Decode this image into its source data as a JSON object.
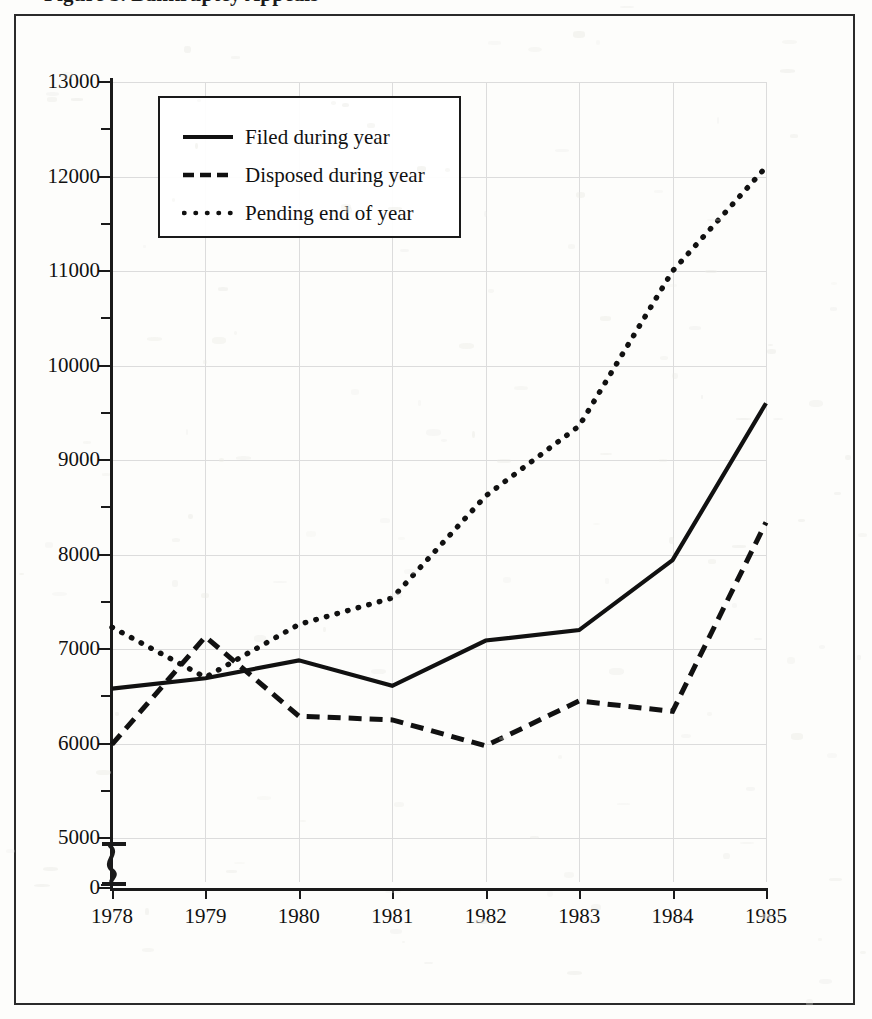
{
  "figure": {
    "title_partial": "Figure 3. Bankruptcy Appeals",
    "frame_visible": true
  },
  "legend": {
    "position": "top-left-inside",
    "entries": [
      {
        "label": "Filed during year",
        "style": "solid",
        "icon": "solid-line-icon"
      },
      {
        "label": "Disposed during year",
        "style": "dashed",
        "icon": "dashed-line-icon"
      },
      {
        "label": "Pending end of year",
        "style": "dotted",
        "icon": "dotted-line-icon"
      }
    ]
  },
  "axes": {
    "y_major_labels": [
      "13000",
      "12000",
      "11000",
      "10000",
      "9000",
      "8000",
      "7000",
      "6000",
      "5000",
      "0"
    ],
    "y_major_values": [
      13000,
      12000,
      11000,
      10000,
      9000,
      8000,
      7000,
      6000,
      5000,
      0
    ],
    "y_minor_values": [
      12500,
      11500,
      10500,
      9500,
      8500,
      7500,
      6500,
      5500,
      4500
    ],
    "y_axis_break": true,
    "y_axis_break_between": [
      0,
      5000
    ],
    "x_labels": [
      "1978",
      "1979",
      "1980",
      "1981",
      "1982",
      "1983",
      "1984",
      "1985"
    ]
  },
  "chart_data": {
    "type": "line",
    "title": "Figure 3. Bankruptcy Appeals",
    "xlabel": "",
    "ylabel": "",
    "x": [
      1978,
      1979,
      1980,
      1981,
      1982,
      1983,
      1984,
      1985
    ],
    "categories": [
      "1978",
      "1979",
      "1980",
      "1981",
      "1982",
      "1983",
      "1984",
      "1985"
    ],
    "ylim": [
      5000,
      13000
    ],
    "ytick_step": 1000,
    "yminor_step": 500,
    "grid": true,
    "legend_position": "upper left",
    "axis_break": {
      "present": true,
      "from": 0,
      "to": 5000
    },
    "series": [
      {
        "name": "Filed during year",
        "style": "solid",
        "values": [
          6580,
          6690,
          6880,
          6610,
          7090,
          7200,
          7940,
          9600
        ]
      },
      {
        "name": "Disposed during year",
        "style": "dashed",
        "values": [
          5990,
          7130,
          6290,
          6250,
          5975,
          6450,
          6340,
          8340
        ]
      },
      {
        "name": "Pending end of year",
        "style": "dotted",
        "values": [
          7230,
          6700,
          7260,
          7540,
          8620,
          9360,
          11000,
          12100
        ]
      }
    ]
  }
}
